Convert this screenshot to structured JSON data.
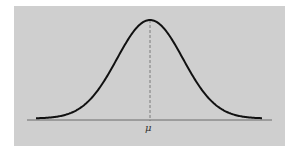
{
  "chart_data": {
    "type": "line",
    "title": "",
    "subtitle": "",
    "xlabel": "",
    "ylabel": "",
    "x_tick_labels": [
      "μ"
    ],
    "mean_label": "μ",
    "series": [
      {
        "name": "normal density",
        "x": [
          -3.5,
          -3,
          -2.5,
          -2,
          -1.5,
          -1,
          -0.5,
          0,
          0.5,
          1,
          1.5,
          2,
          2.5,
          3,
          3.5
        ],
        "values": [
          0.001,
          0.004,
          0.018,
          0.054,
          0.13,
          0.242,
          0.352,
          0.399,
          0.352,
          0.242,
          0.13,
          0.054,
          0.018,
          0.004,
          0.001
        ]
      }
    ],
    "annotations": [
      {
        "type": "dashed-vline",
        "x": 0,
        "label": "μ"
      }
    ],
    "grid": false,
    "legend": "none",
    "colors": {
      "background": "#cfcfcf",
      "curve": "#111111",
      "axis": "#555555",
      "mean_line": "#777777"
    }
  },
  "labels": {
    "mu": "μ"
  }
}
